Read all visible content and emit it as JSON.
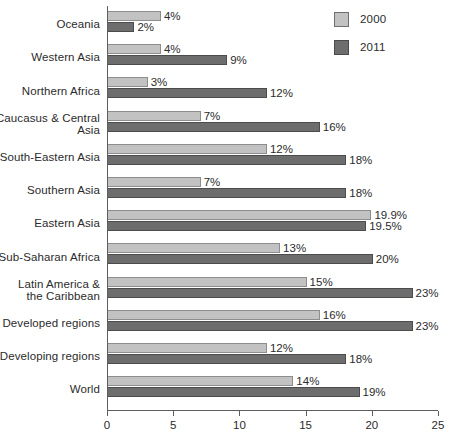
{
  "chart_data": {
    "type": "bar",
    "orientation": "horizontal",
    "title": "",
    "xlabel": "",
    "ylabel": "",
    "xlim": [
      0,
      25
    ],
    "xticks": [
      0,
      5,
      10,
      15,
      20,
      25
    ],
    "xtick_labels": [
      "0",
      "5",
      "10",
      "15",
      "20",
      "25"
    ],
    "grid": false,
    "legend_position": "top-right",
    "colors": {
      "series_2000": "#c2c2c2",
      "series_2011": "#6d6d6d",
      "axis": "#5e5e5e",
      "text": "#2b2b2b",
      "background": "#ffffff"
    },
    "categories": [
      "Oceania",
      "Western Asia",
      "Northern Africa",
      "Caucasus & Central Asia",
      "South-Eastern Asia",
      "Southern Asia",
      "Eastern Asia",
      "Sub-Saharan Africa",
      "Latin America & the Caribbean",
      "Developed regions",
      "Developing regions",
      "World"
    ],
    "category_lines": [
      [
        "Oceania"
      ],
      [
        "Western Asia"
      ],
      [
        "Northern Africa"
      ],
      [
        "Caucasus & Central",
        "Asia"
      ],
      [
        "South-Eastern Asia"
      ],
      [
        "Southern Asia"
      ],
      [
        "Eastern Asia"
      ],
      [
        "Sub-Saharan Africa"
      ],
      [
        "Latin America &",
        "the Caribbean"
      ],
      [
        "Developed regions"
      ],
      [
        "Developing regions"
      ],
      [
        "World"
      ]
    ],
    "series": [
      {
        "name": "2000",
        "values": [
          4,
          4,
          3,
          7,
          12,
          7,
          19.9,
          13,
          15,
          16,
          12,
          14
        ],
        "labels": [
          "4%",
          "4%",
          "3%",
          "7%",
          "12%",
          "7%",
          "19.9%",
          "13%",
          "15%",
          "16%",
          "12%",
          "14%"
        ]
      },
      {
        "name": "2011",
        "values": [
          2,
          9,
          12,
          16,
          18,
          18,
          19.5,
          20,
          23,
          23,
          18,
          19
        ],
        "labels": [
          "2%",
          "9%",
          "12%",
          "16%",
          "18%",
          "18%",
          "19.5%",
          "20%",
          "23%",
          "23%",
          "18%",
          "19%"
        ]
      }
    ]
  },
  "legend": {
    "items": [
      {
        "label": "2000",
        "swatch": "series_2000"
      },
      {
        "label": "2011",
        "swatch": "series_2011"
      }
    ]
  }
}
